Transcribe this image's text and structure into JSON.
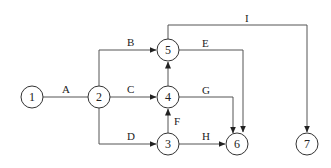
{
  "diagram": {
    "type": "activity-on-arrow network",
    "nodes": [
      {
        "id": "1",
        "label": "1"
      },
      {
        "id": "2",
        "label": "2"
      },
      {
        "id": "3",
        "label": "3"
      },
      {
        "id": "4",
        "label": "4"
      },
      {
        "id": "5",
        "label": "5"
      },
      {
        "id": "6",
        "label": "6"
      },
      {
        "id": "7",
        "label": "7"
      }
    ],
    "edges": [
      {
        "label": "A",
        "from": "1",
        "to": "2"
      },
      {
        "label": "B",
        "from": "2",
        "to": "5"
      },
      {
        "label": "C",
        "from": "2",
        "to": "4"
      },
      {
        "label": "D",
        "from": "2",
        "to": "3"
      },
      {
        "label": "E",
        "from": "5",
        "to": "6"
      },
      {
        "label": "F",
        "from": "3",
        "to": "4"
      },
      {
        "label": "G",
        "from": "4",
        "to": "6"
      },
      {
        "label": "H",
        "from": "3",
        "to": "6"
      },
      {
        "label": "I",
        "from": "5",
        "to": "7"
      },
      {
        "label": "",
        "from": "4",
        "to": "5",
        "dummy": true
      }
    ]
  }
}
